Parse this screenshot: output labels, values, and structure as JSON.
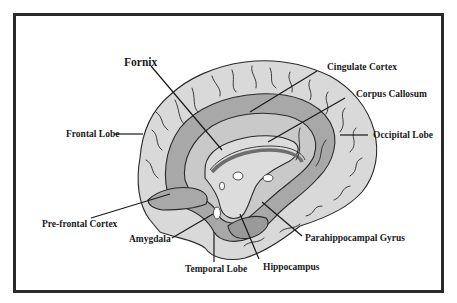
{
  "diagram": {
    "title": "",
    "colors": {
      "frame": "#2a2a2a",
      "background": "#ffffff",
      "cortex_light": "#d9d9d9",
      "limbic_mid": "#a8a8a8",
      "corpus_callosum": "#c9c9c9",
      "fornix_dark": "#7a7a7a",
      "line": "#1a1a1a"
    },
    "labels": {
      "fornix": "Fornix",
      "cingulate_cortex": "Cingulate Cortex",
      "corpus_callosum": "Corpus Callosum",
      "frontal_lobe": "Frontal Lobe",
      "occipital_lobe": "Occipital Lobe",
      "prefrontal_cortex": "Pre-frontal Cortex",
      "amygdala": "Amygdala",
      "temporal_lobe": "Temporal Lobe",
      "hippocampus": "Hippocampus",
      "parahippocampal_gyrus": "Parahippocampal Gyrus"
    }
  }
}
